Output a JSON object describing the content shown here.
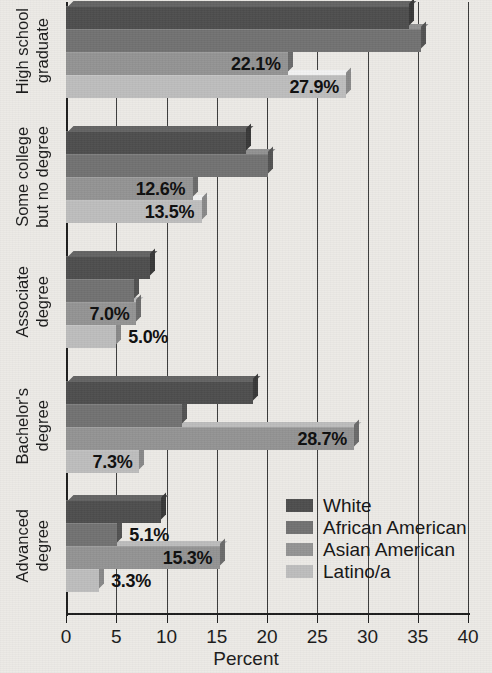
{
  "chart_data": {
    "type": "bar",
    "orientation": "horizontal",
    "title": "",
    "xlabel": "Percent",
    "ylabel": "",
    "xlim": [
      0,
      40
    ],
    "xticks": [
      "0",
      "5",
      "10",
      "15",
      "20",
      "25",
      "30",
      "35",
      "40"
    ],
    "grid": true,
    "legend_position": "inside-lower-right",
    "categories": [
      "High school graduate",
      "Some college but no degree",
      "Associate degree",
      "Bachelor's degree",
      "Advanced degree"
    ],
    "category_lines": [
      [
        "High school",
        "graduate"
      ],
      [
        "Some college",
        "but no degree"
      ],
      [
        "Associate",
        "degree"
      ],
      [
        "Bachelor's",
        "degree"
      ],
      [
        "Advanced",
        "degree"
      ]
    ],
    "series": [
      {
        "name": "White",
        "color": "#4d4d4d",
        "values": [
          34.1,
          17.9,
          8.4,
          18.6,
          9.5
        ],
        "labels": [
          "34.1%",
          "17.9%",
          "8.4%",
          "18.6%",
          "9.5%"
        ]
      },
      {
        "name": "African American",
        "color": "#717171",
        "values": [
          35.3,
          20.1,
          6.8,
          11.5,
          5.1
        ],
        "labels": [
          "35.3%",
          "20.1%",
          "6.8%",
          "11.5%",
          "5.1%"
        ]
      },
      {
        "name": "Asian American",
        "color": "#939393",
        "values": [
          22.1,
          12.6,
          7.0,
          28.7,
          15.3
        ],
        "labels": [
          "22.1%",
          "12.6%",
          "7.0%",
          "28.7%",
          "15.3%"
        ]
      },
      {
        "name": "Latino/a",
        "color": "#bdbdbd",
        "values": [
          27.9,
          13.5,
          5.0,
          7.3,
          3.3
        ],
        "labels": [
          "27.9%",
          "13.5%",
          "5.0%",
          "7.3%",
          "3.3%"
        ]
      }
    ]
  },
  "legend": {
    "items": [
      {
        "label": "White",
        "color": "#4d4d4d"
      },
      {
        "label": "African American",
        "color": "#717171"
      },
      {
        "label": "Asian American",
        "color": "#939393"
      },
      {
        "label": "Latino/a",
        "color": "#bdbdbd"
      }
    ]
  },
  "axis": {
    "x_title": "Percent",
    "x_ticks": [
      "0",
      "5",
      "10",
      "15",
      "20",
      "25",
      "30",
      "35",
      "40"
    ]
  }
}
